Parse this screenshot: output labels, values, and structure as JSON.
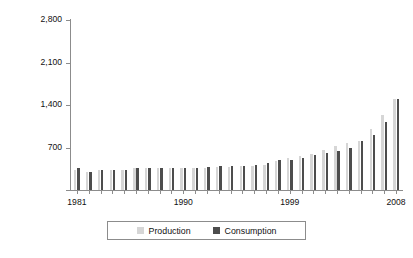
{
  "chart_data": {
    "type": "bar",
    "title": "",
    "subtitle": "",
    "xlabel": "",
    "ylabel": "Billion cubic feet",
    "ylim": [
      0,
      2800
    ],
    "yticks": [
      0,
      700,
      1400,
      2100,
      2800
    ],
    "ytick_labels": [
      "",
      "700",
      "1,400",
      "2,100",
      "2,800"
    ],
    "grid": false,
    "legend_position": "bottom",
    "categories": [
      "1981",
      "1982",
      "1983",
      "1984",
      "1985",
      "1986",
      "1987",
      "1988",
      "1989",
      "1990",
      "1991",
      "1992",
      "1993",
      "1994",
      "1995",
      "1996",
      "1997",
      "1998",
      "1999",
      "2000",
      "2001",
      "2002",
      "2003",
      "2004",
      "2005",
      "2006",
      "2007",
      "2008"
    ],
    "xtick_labels": [
      "1981",
      "1990",
      "1999",
      "2008"
    ],
    "series": [
      {
        "name": "Production",
        "color": "#d6d6d6",
        "values": [
          330,
          300,
          325,
          330,
          335,
          355,
          360,
          365,
          365,
          365,
          370,
          370,
          375,
          385,
          390,
          400,
          420,
          470,
          530,
          560,
          600,
          660,
          720,
          780,
          800,
          1000,
          1230,
          1500
        ]
      },
      {
        "name": "Consumption",
        "color": "#4d4d4d",
        "values": [
          370,
          300,
          330,
          330,
          335,
          360,
          360,
          370,
          360,
          370,
          370,
          375,
          390,
          395,
          400,
          420,
          450,
          490,
          500,
          520,
          570,
          610,
          650,
          700,
          800,
          900,
          1120,
          1500
        ]
      }
    ]
  },
  "legend": {
    "entries": [
      {
        "label": "Production",
        "swatch": "legend-swatch-production"
      },
      {
        "label": "Consumption",
        "swatch": "legend-swatch-consumption"
      }
    ]
  },
  "axis": {
    "y_title": "Billion cubic feet"
  }
}
